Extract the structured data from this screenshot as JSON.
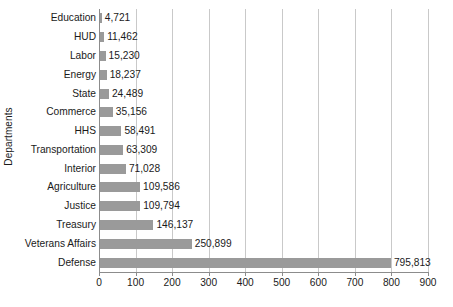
{
  "chart_data": {
    "type": "bar",
    "orientation": "horizontal",
    "title": "",
    "xlabel": "",
    "ylabel": "Departments",
    "xlim": [
      0,
      900
    ],
    "ylim": null,
    "grid": true,
    "legend": null,
    "x_ticks": [
      "0",
      "100",
      "200",
      "300",
      "400",
      "500",
      "600",
      "700",
      "800",
      "900"
    ],
    "x_tick_values": [
      0,
      100,
      200,
      300,
      400,
      500,
      600,
      700,
      800,
      900
    ],
    "x_unit_note": "values plotted in thousands against tick scale",
    "categories": [
      "Education",
      "HUD",
      "Labor",
      "Energy",
      "State",
      "Commerce",
      "HHS",
      "Transportation",
      "Interior",
      "Agriculture",
      "Justice",
      "Treasury",
      "Veterans Affairs",
      "Defense"
    ],
    "values": [
      4721,
      11462,
      15230,
      18237,
      24489,
      35156,
      58491,
      63309,
      71028,
      109586,
      109794,
      146137,
      250899,
      795813
    ],
    "value_labels": [
      "4,721",
      "11,462",
      "15,230",
      "18,237",
      "24,489",
      "35,156",
      "58,491",
      "63,309",
      "71,028",
      "109,586",
      "109,794",
      "146,137",
      "250,899",
      "795,813"
    ],
    "bar_color": "#9a9a9a",
    "grid_color": "#c9c9c9",
    "axis_color": "#8c8c8c",
    "text_color": "#1a1a1a"
  }
}
